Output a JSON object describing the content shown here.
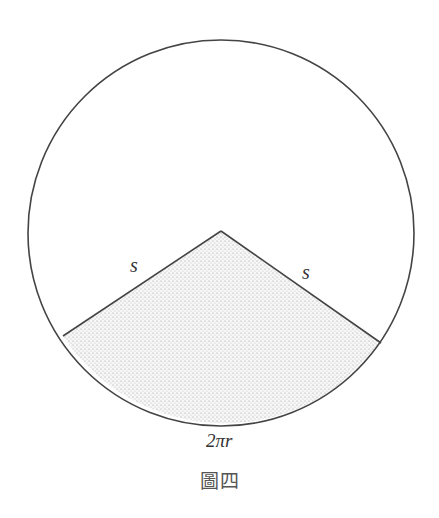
{
  "figure": {
    "caption": "圖四",
    "circle": {
      "cx": 221,
      "cy": 233,
      "r": 193,
      "stroke": "#444444"
    },
    "sector": {
      "apex": [
        221,
        231
      ],
      "left_end": [
        63,
        336
      ],
      "right_end": [
        381,
        343
      ],
      "fill_pattern": "dotted",
      "fill_color": "#f2f2f2",
      "dot_color": "#9a9a9a"
    },
    "labels": {
      "left_radius": "s",
      "right_radius": "s",
      "arc_length": "2πr"
    }
  }
}
